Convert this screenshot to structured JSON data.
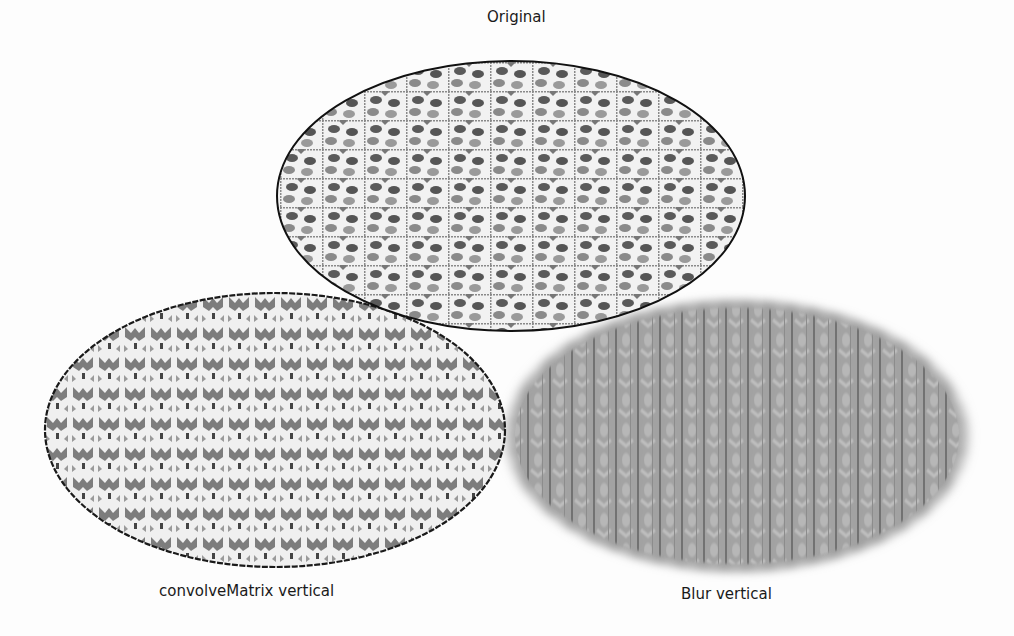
{
  "panels": [
    {
      "id": "original",
      "label": "Original",
      "effect": "none"
    },
    {
      "id": "convolve",
      "label": "convolveMatrix vertical",
      "effect": "convolveMatrix-vertical"
    },
    {
      "id": "blur",
      "label": "Blur vertical",
      "effect": "gaussian-blur-vertical"
    }
  ],
  "colors": {
    "background": "#fdfdfd",
    "stroke": "#111111",
    "dot_dark": "#555555",
    "dot_mid": "#888888",
    "blur_fill": "#9a9a9a"
  }
}
